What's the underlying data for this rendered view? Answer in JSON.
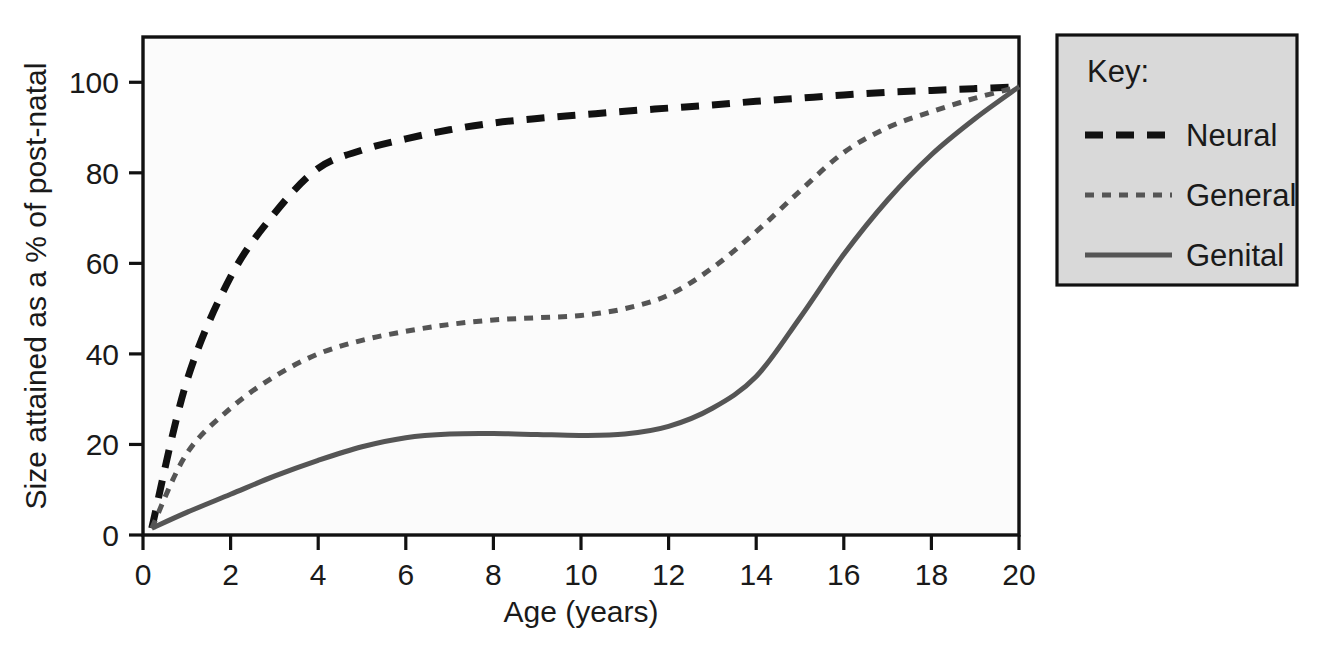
{
  "chart_data": {
    "type": "line",
    "title": "",
    "xlabel": "Age (years)",
    "ylabel": "Size attained as a % of post-natal",
    "xlim": [
      0,
      20
    ],
    "ylim": [
      0,
      110
    ],
    "grid": false,
    "legend_position": "right-outside",
    "legend_title": "Key:",
    "xticks": [
      0,
      2,
      4,
      6,
      8,
      10,
      12,
      14,
      16,
      18,
      20
    ],
    "xtick_labels": [
      "0",
      "2",
      "4",
      "6",
      "8",
      "10",
      "12",
      "14",
      "16",
      "18",
      "20"
    ],
    "yticks": [
      0,
      20,
      40,
      60,
      80,
      100
    ],
    "ytick_labels": [
      "0",
      "20",
      "40",
      "60",
      "80",
      "100"
    ],
    "x": [
      0.2,
      1,
      2,
      3,
      4,
      5,
      6,
      7,
      8,
      9,
      10,
      11,
      12,
      13,
      14,
      15,
      16,
      17,
      18,
      19,
      20
    ],
    "series": [
      {
        "name": "Neural",
        "label": "Neural",
        "style": "long-dash",
        "color": "#111111",
        "width": 7,
        "dash": "18,13",
        "values": [
          1.5,
          34,
          57,
          71,
          81,
          85,
          87.5,
          89.5,
          91,
          92,
          92.8,
          93.6,
          94.3,
          95,
          95.8,
          96.5,
          97.2,
          97.8,
          98.2,
          98.6,
          99
        ]
      },
      {
        "name": "General",
        "label": "General",
        "style": "short-dash",
        "color": "#555555",
        "width": 5,
        "dash": "9,8",
        "values": [
          1.5,
          18,
          28,
          35,
          40,
          43,
          45,
          46.5,
          47.5,
          48,
          48.5,
          50,
          53,
          59,
          67,
          76,
          84.5,
          90,
          93.5,
          96.5,
          99
        ]
      },
      {
        "name": "Genital",
        "label": "Genital",
        "style": "solid",
        "color": "#555555",
        "width": 5,
        "dash": "none",
        "values": [
          1.5,
          5,
          9,
          13,
          16.5,
          19.5,
          21.5,
          22.3,
          22.4,
          22.2,
          22,
          22.3,
          24,
          28,
          35,
          48,
          62,
          74,
          84,
          92,
          99
        ]
      }
    ]
  },
  "legend": {
    "title": "Key:",
    "entries": [
      {
        "label": "Neural"
      },
      {
        "label": "General"
      },
      {
        "label": "Genital"
      }
    ]
  },
  "axes": {
    "x_title": "Age (years)",
    "y_title": "Size attained as a % of post-natal"
  },
  "colors": {
    "neural": "#111111",
    "general": "#555555",
    "genital": "#555555",
    "legend_background": "#d9d9d9",
    "plot_background": "#fbfbfb",
    "frame": "#111111"
  }
}
